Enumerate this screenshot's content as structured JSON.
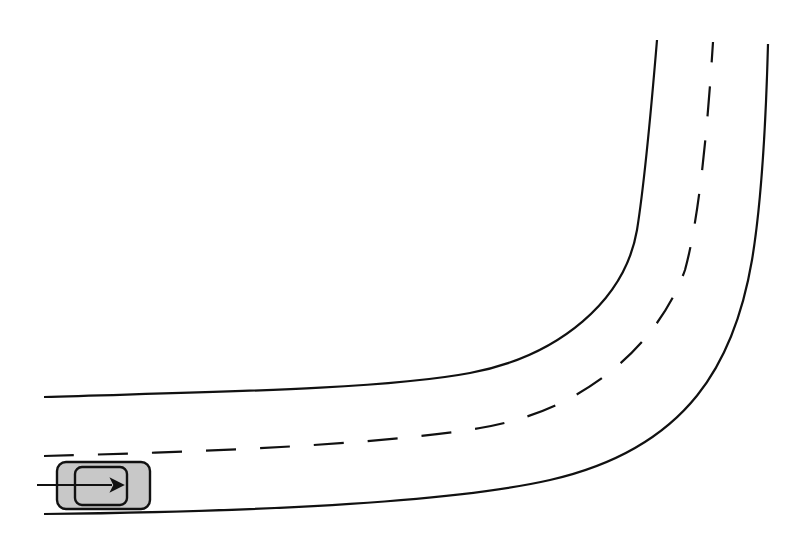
{
  "diagram": {
    "description": "Top-down view of a two-lane road curving left-to-up with a car heading right",
    "colors": {
      "background": "#ffffff",
      "line": "#111111",
      "car_fill": "#c8c8c8",
      "car_stroke": "#111111"
    },
    "road": {
      "inner_edge": "M44,397 C200,392 380,390 470,373 C560,356 625,300 637,230 C645,180 652,100 657,40",
      "center_line": "M44,456 C200,452 380,445 480,428 C590,410 660,340 685,270 C700,215 708,120 713,42",
      "outer_edge": "M44,514 C220,512 440,505 550,480 C690,448 735,360 752,260 C762,200 766,120 768,44",
      "dash_pattern": "30 24"
    },
    "car": {
      "body": {
        "x": 57,
        "y": 462,
        "width": 93,
        "height": 47,
        "rx": 9
      },
      "cabin": {
        "x": 75,
        "y": 467,
        "width": 52,
        "height": 38,
        "rx": 7
      },
      "direction_arrow": {
        "x1": 37,
        "y1": 485,
        "x2": 112,
        "y2": 485
      },
      "direction": "right"
    }
  }
}
